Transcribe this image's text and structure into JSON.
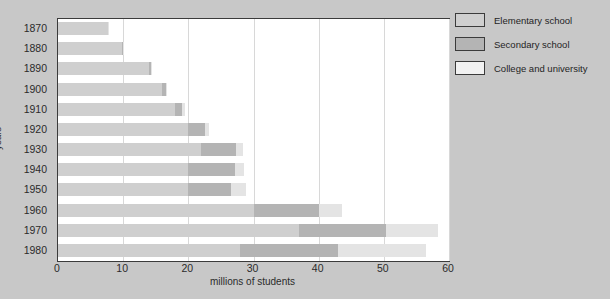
{
  "chart_data": {
    "type": "bar",
    "orientation": "horizontal",
    "stacked": true,
    "title": "School enrollment, 1870-1980",
    "xlabel": "millions of students",
    "ylabel": "years",
    "xlim": [
      0,
      60
    ],
    "xticks": [
      0,
      10,
      20,
      30,
      40,
      50,
      60
    ],
    "xtick_labels": [
      "0",
      "10",
      "20",
      "30",
      "40",
      "50",
      "60"
    ],
    "categories": [
      "1870",
      "1880",
      "1890",
      "1900",
      "1910",
      "1920",
      "1930",
      "1940",
      "1950",
      "1960",
      "1970",
      "1980"
    ],
    "grid": true,
    "grid_axis": "x",
    "legend_position": "right",
    "series": [
      {
        "name": "Elementary school",
        "color": "#cfcfcf",
        "values": [
          7.6,
          9.8,
          14.0,
          16.0,
          18.0,
          20.0,
          22.0,
          20.0,
          20.0,
          30.0,
          37.0,
          28.0
        ]
      },
      {
        "name": "Secondary school",
        "color": "#b4b4b4",
        "values": [
          0.1,
          0.1,
          0.3,
          0.5,
          1.1,
          2.5,
          5.3,
          7.1,
          6.5,
          10.0,
          13.3,
          15.0
        ]
      },
      {
        "name": "College and university",
        "color": "#e4e4e4",
        "values": [
          0.1,
          0.1,
          0.2,
          0.25,
          0.35,
          0.6,
          1.1,
          1.5,
          2.3,
          3.6,
          8.0,
          13.5
        ]
      }
    ],
    "totals": [
      7.8,
      10.0,
      14.5,
      16.75,
      19.45,
      23.1,
      28.4,
      28.6,
      28.8,
      43.6,
      58.3,
      56.5
    ]
  },
  "legend": {
    "items": [
      {
        "label": "Elementary school",
        "color": "#cfcfcf"
      },
      {
        "label": "Secondary school",
        "color": "#b4b4b4"
      },
      {
        "label": "College and university",
        "color": "#f2f2f2"
      }
    ]
  }
}
